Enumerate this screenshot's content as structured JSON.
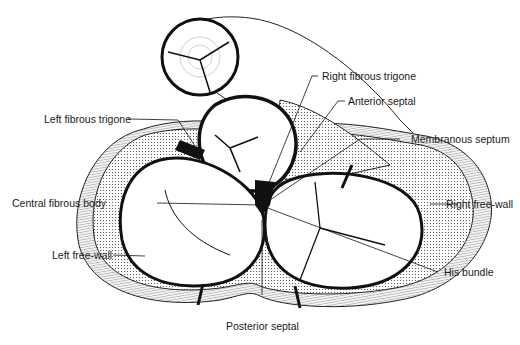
{
  "figure": {
    "colors": {
      "ink": "#111111",
      "background": "#ffffff",
      "stipple": "#555555"
    }
  },
  "labels": {
    "right_fibrous_trigone": "Right fibrous trigone",
    "anterior_septal": "Anterior septal",
    "left_fibrous_trigone": "Left fibrous trigone",
    "membranous_septum": "Membranous septum",
    "central_fibrous_body": "Central fibrous body",
    "right_free_wall": "Right free-wall",
    "left_free_wall": "Left free-wall",
    "his_bundle": "His bundle",
    "posterior_septal": "Posterior septal"
  }
}
